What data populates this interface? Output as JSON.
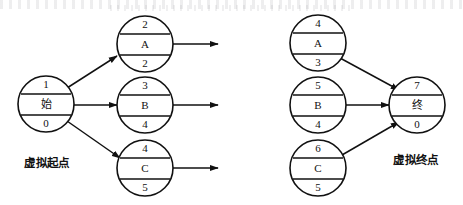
{
  "diagram": {
    "type": "aoa-network-diagram",
    "stroke_color": "#111111",
    "background_color": "#ffffff",
    "captions": {
      "left": "虚拟起点",
      "right": "虚拟终点"
    },
    "left_group": {
      "start_node": {
        "id": "start",
        "top": "1",
        "middle": "始",
        "bottom": "0",
        "cx": 46,
        "cy": 104,
        "r": 28
      },
      "activity_nodes": [
        {
          "id": "left-a",
          "top": "2",
          "middle": "A",
          "bottom": "2",
          "cx": 145,
          "cy": 44,
          "r": 28
        },
        {
          "id": "left-b",
          "top": "3",
          "middle": "B",
          "bottom": "4",
          "cx": 145,
          "cy": 105,
          "r": 28
        },
        {
          "id": "left-c",
          "top": "4",
          "middle": "C",
          "bottom": "5",
          "cx": 145,
          "cy": 168,
          "r": 28
        }
      ]
    },
    "right_group": {
      "end_node": {
        "id": "end",
        "top": "7",
        "middle": "终",
        "bottom": "0",
        "cx": 417,
        "cy": 105,
        "r": 28
      },
      "activity_nodes": [
        {
          "id": "right-a",
          "top": "4",
          "middle": "A",
          "bottom": "3",
          "cx": 318,
          "cy": 43,
          "r": 28
        },
        {
          "id": "right-b",
          "top": "5",
          "middle": "B",
          "bottom": "4",
          "cx": 318,
          "cy": 105,
          "r": 28
        },
        {
          "id": "right-c",
          "top": "6",
          "middle": "C",
          "bottom": "5",
          "cx": 318,
          "cy": 168,
          "r": 28
        }
      ]
    },
    "edges": [
      {
        "id": "start-to-a",
        "from": "start",
        "to": "left-a",
        "arrow": true
      },
      {
        "id": "start-to-b",
        "from": "start",
        "to": "left-b",
        "arrow": true
      },
      {
        "id": "start-to-c",
        "from": "start",
        "to": "left-c",
        "arrow": true
      },
      {
        "id": "a-out",
        "from": "left-a",
        "to": "open",
        "arrow": true
      },
      {
        "id": "b-out",
        "from": "left-b",
        "to": "open",
        "arrow": true
      },
      {
        "id": "c-out",
        "from": "left-c",
        "to": "open",
        "arrow": true
      },
      {
        "id": "a-to-end",
        "from": "right-a",
        "to": "end",
        "arrow": true
      },
      {
        "id": "b-to-end",
        "from": "right-b",
        "to": "end",
        "arrow": true
      },
      {
        "id": "c-to-end",
        "from": "right-c",
        "to": "end",
        "arrow": true
      }
    ]
  }
}
